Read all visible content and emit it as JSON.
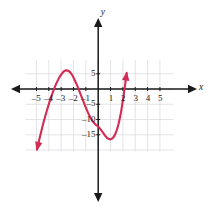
{
  "figure": {
    "background": "#ffffff",
    "grid_color": "#d9d9de",
    "axis_color": "#1a1a1a",
    "curve_color": "#d42b55",
    "label_color": "#1a1a1a"
  },
  "chart_data": {
    "type": "line",
    "title": "",
    "subtitle": "",
    "xlabel": "x",
    "ylabel": "y",
    "xlim": [
      -5.9,
      6.1
    ],
    "ylim": [
      -20.5,
      9.5
    ],
    "grid": true,
    "legend": null,
    "x_ticks": [
      -5,
      -4,
      -3,
      -2,
      -1,
      1,
      2,
      3,
      4,
      5
    ],
    "x_tick_labels": [
      "–5",
      "–4",
      "–3",
      "–2",
      "–1",
      "1",
      "2",
      "3",
      "4",
      "5"
    ],
    "y_ticks": [
      5,
      -5,
      -10,
      -15
    ],
    "y_tick_labels": [
      "5",
      "–5",
      "–10",
      "–15"
    ],
    "annotations": [
      {
        "name": "x-axis-name",
        "text": "x"
      },
      {
        "name": "y-axis-name",
        "text": "y"
      }
    ],
    "series": [
      {
        "name": "cubic-curve",
        "color": "#d42b55",
        "arrow_start": true,
        "arrow_end": true,
        "x": [
          -4.95,
          -4.7,
          -4.4,
          -4.1,
          -3.8,
          -3.5,
          -3.2,
          -3.0,
          -2.8,
          -2.6,
          -2.4,
          -2.2,
          -2.0,
          -1.7,
          -1.4,
          -1.1,
          -0.8,
          -0.5,
          -0.2,
          0.0,
          0.3,
          0.6,
          0.8,
          1.0,
          1.2,
          1.4,
          1.6,
          1.8,
          2.0,
          2.15,
          2.3
        ],
        "y": [
          -19.8,
          -15.4,
          -10.6,
          -6.3,
          -2.5,
          0.8,
          3.4,
          4.7,
          5.7,
          6.1,
          5.9,
          5.1,
          3.8,
          1.1,
          -2.0,
          -5.1,
          -8.0,
          -10.3,
          -11.7,
          -12.3,
          -13.8,
          -15.5,
          -16.3,
          -16.5,
          -16.0,
          -14.6,
          -12.2,
          -8.6,
          -3.7,
          0.5,
          5.2
        ]
      }
    ],
    "features": {
      "local_maximum": {
        "x": -3.0,
        "y": 6.0
      },
      "local_minimum": {
        "x": 0.9,
        "y": -16.5
      },
      "y_intercept": -12.3,
      "x_intercepts": [
        -4.0,
        -2.2,
        2.0
      ]
    }
  }
}
